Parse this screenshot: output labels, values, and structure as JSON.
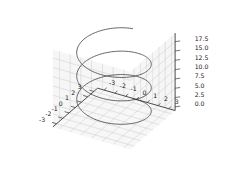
{
  "figure": {
    "background_color": "#ffffff",
    "type": "matplotlib-3d-axes",
    "projection": "3d"
  },
  "chart_data": {
    "type": "line",
    "plot_kind": "3d-parametric-helix",
    "title": "",
    "xlabel": "",
    "ylabel": "",
    "zlabel": "",
    "grid": true,
    "legend": null,
    "line_color": "#555555",
    "line_width": 0.9,
    "pane_color": "#f2f2f2",
    "grid_color": "#c8c8c8",
    "spine_color": "#3a3a3a",
    "view": {
      "elev": 30,
      "azim": -60
    },
    "xlim": [
      -3.6,
      3.6
    ],
    "ylim": [
      -3.6,
      3.6
    ],
    "zlim": [
      -1.0,
      19.8
    ],
    "xticks": [
      "-3",
      "-2",
      "-1",
      "0",
      "1",
      "2",
      "3"
    ],
    "xtick_values": [
      -3,
      -2,
      -1,
      0,
      1,
      2,
      3
    ],
    "yticks": [
      "-3",
      "-2",
      "-1",
      "0",
      "1",
      "2",
      "3"
    ],
    "ytick_values": [
      -3,
      -2,
      -1,
      0,
      1,
      2,
      3
    ],
    "zticks": [
      "0.0",
      "2.5",
      "5.0",
      "7.5",
      "10.0",
      "12.5",
      "15.0",
      "17.5"
    ],
    "ztick_values": [
      0.0,
      2.5,
      5.0,
      7.5,
      10.0,
      12.5,
      15.0,
      17.5
    ],
    "series": [
      {
        "name": "helix",
        "parametric": {
          "x_expr": "3*cos(t)",
          "y_expr": "3*sin(t)",
          "z_expr": "t",
          "t_start": 0,
          "t_end": 18.8496,
          "turns": 3,
          "radius": 3,
          "samples": 400
        }
      }
    ]
  }
}
